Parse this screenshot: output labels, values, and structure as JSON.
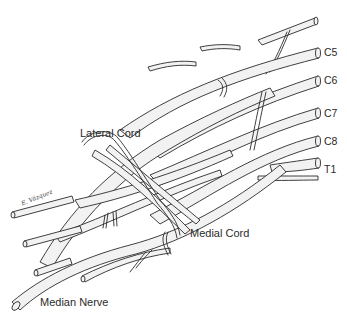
{
  "diagram": {
    "labels": {
      "lateral_cord": "Lateral Cord",
      "medial_cord": "Medial Cord",
      "median_nerve": "Median Nerve"
    },
    "roots": [
      {
        "label": "C5"
      },
      {
        "label": "C6"
      },
      {
        "label": "C7"
      },
      {
        "label": "C8"
      },
      {
        "label": "T1"
      }
    ],
    "signature": "E. Vázquez",
    "colors": {
      "line": "#2a2a2a",
      "nerve_fill": "#f2f2f2",
      "background": "#ffffff"
    }
  }
}
